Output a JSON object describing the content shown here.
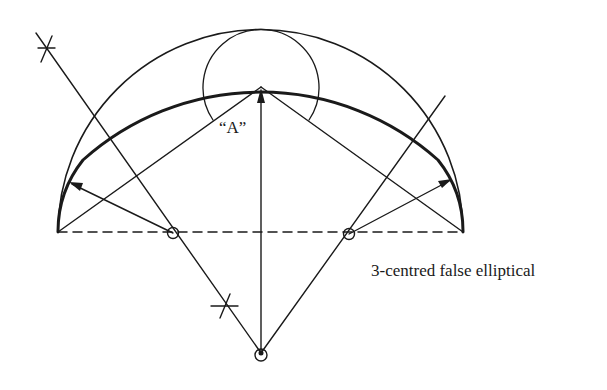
{
  "diagram": {
    "title": "3-centred false elliptical",
    "labels": {
      "crown_label": "“A”",
      "caption": "3-centred false elliptical"
    },
    "colors": {
      "stroke": "#1a1a1a",
      "background": "#ffffff"
    },
    "points": {
      "springing_left": [
        58,
        232
      ],
      "springing_right": [
        463,
        232
      ],
      "crown": [
        261,
        87
      ],
      "centre_left": [
        173,
        233
      ],
      "centre_right": [
        349,
        234
      ],
      "centre_bottom": [
        261,
        353
      ],
      "star_upper": [
        46,
        48
      ],
      "star_lower": [
        227,
        306
      ]
    },
    "elements": [
      "outer semicircle (span diameter)",
      "circle at crown (radius = rise difference)",
      "thick 3-centred arch curve",
      "dashed springing line",
      "chords from springing points to crown",
      "perpendicular bisector line with construction stars",
      "radius lines with arrows"
    ]
  }
}
